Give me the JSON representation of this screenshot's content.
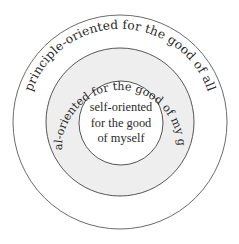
{
  "diagram": {
    "title": "",
    "rings": [
      {
        "id": "outer",
        "label": "principle-oriented for the good of all",
        "fill": "#ffffff",
        "stroke": "#6b6b6b"
      },
      {
        "id": "middle",
        "label": "social-oriented for the good of my group",
        "fill": "#eeeeee",
        "stroke": "#555555"
      },
      {
        "id": "inner",
        "label_lines": [
          "self-oriented",
          "for the good",
          "of myself"
        ],
        "fill": "#ffffff",
        "stroke": "#555555"
      }
    ]
  }
}
